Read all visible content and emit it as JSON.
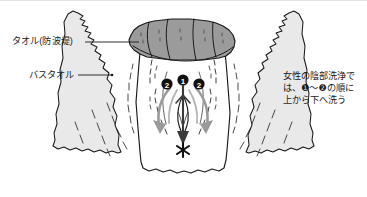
{
  "figure": {
    "background_color": "#ffffff"
  },
  "labels": {
    "towel_dam": "タオル(防波堤)",
    "bath_towel": "バスタオル"
  },
  "caption": {
    "text": "女性の陰部洗浄で\nは、❶〜❷の順に\n上から下へ洗う"
  },
  "markers": {
    "step_one": "❶",
    "step_two_left": "❷",
    "step_two_right": "❷",
    "anus_mark": "✳"
  },
  "colors": {
    "outline": "#1a1a1a",
    "rolled_towel_fill": "#9b9b9b",
    "rolled_towel_shade": "#8a8a8a",
    "bath_towel_fill": "#e9e9e9",
    "bath_towel_shade": "#dcdcdc",
    "skin_fill": "#ffffff",
    "arrow_gray": "#9a9a9a",
    "arrow_dark": "#3a3a3a",
    "marker_fill": "#111111",
    "marker_text": "#ffffff",
    "text_color": "#1a1a1a",
    "frame_line": "#e4e4e4"
  }
}
